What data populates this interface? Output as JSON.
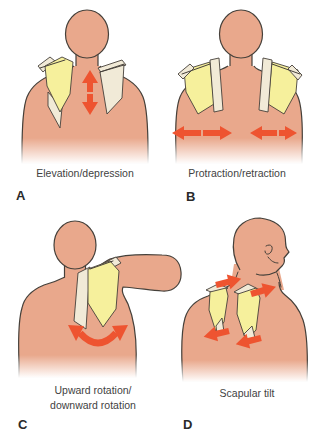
{
  "colors": {
    "skin": "#e9a88c",
    "outline": "#45403a",
    "scapula": "#f6f09c",
    "bone": "#f1ead7",
    "arrow": "#ee5430",
    "label": "#3f3f3f"
  },
  "panels": [
    {
      "letter": "A",
      "label": "Elevation/depression",
      "arrow_icon": "vertical-double-arrow-icon"
    },
    {
      "letter": "B",
      "label": "Protraction/retraction",
      "arrow_icon": "horizontal-double-arrows-icon"
    },
    {
      "letter": "C",
      "label": "Upward rotation/\ndownward rotation",
      "arrow_icon": "curved-rotation-arrow-icon"
    },
    {
      "letter": "D",
      "label": "Scapular tilt",
      "arrow_icon": "tilt-arrows-icon"
    }
  ]
}
